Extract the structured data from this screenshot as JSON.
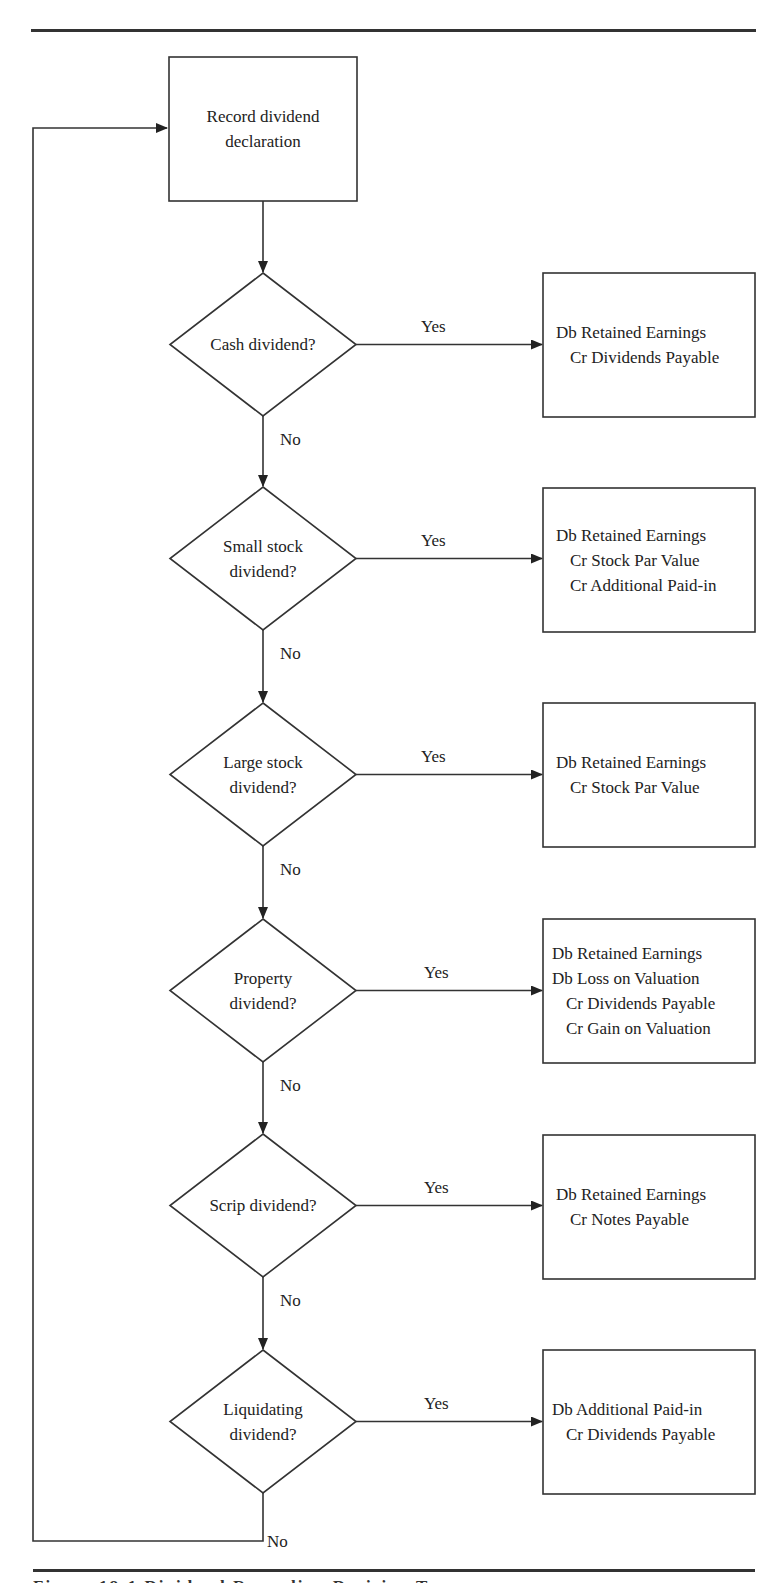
{
  "start": {
    "label_lines": [
      "Record dividend",
      "declaration"
    ]
  },
  "branch_labels": {
    "yes": "Yes",
    "no": "No"
  },
  "decisions": [
    {
      "question_lines": [
        "Cash dividend?"
      ],
      "entry_lines": [
        {
          "text": "Db Retained Earnings",
          "side": "db"
        },
        {
          "text": "Cr Dividends Payable",
          "side": "cr"
        }
      ]
    },
    {
      "question_lines": [
        "Small stock",
        "dividend?"
      ],
      "entry_lines": [
        {
          "text": "Db Retained Earnings",
          "side": "db"
        },
        {
          "text": "Cr Stock Par Value",
          "side": "cr"
        },
        {
          "text": "Cr Additional Paid-in",
          "side": "cr"
        }
      ]
    },
    {
      "question_lines": [
        "Large stock",
        "dividend?"
      ],
      "entry_lines": [
        {
          "text": "Db Retained Earnings",
          "side": "db"
        },
        {
          "text": "Cr Stock Par Value",
          "side": "cr"
        }
      ]
    },
    {
      "question_lines": [
        "Property",
        "dividend?"
      ],
      "entry_lines": [
        {
          "text": "Db Retained Earnings",
          "side": "db"
        },
        {
          "text": "Db Loss on Valuation",
          "side": "db"
        },
        {
          "text": "Cr Dividends Payable",
          "side": "cr"
        },
        {
          "text": "Cr Gain on Valuation",
          "side": "cr"
        }
      ]
    },
    {
      "question_lines": [
        "Scrip dividend?"
      ],
      "entry_lines": [
        {
          "text": "Db Retained Earnings",
          "side": "db"
        },
        {
          "text": "Cr Notes Payable",
          "side": "cr"
        }
      ]
    },
    {
      "question_lines": [
        "Liquidating",
        "dividend?"
      ],
      "entry_lines": [
        {
          "text": "Db Additional Paid-in",
          "side": "db"
        },
        {
          "text": "Cr Dividends Payable",
          "side": "cr"
        }
      ]
    }
  ],
  "caption": "Figure 18-1  Dividend Recording Decision Tree"
}
